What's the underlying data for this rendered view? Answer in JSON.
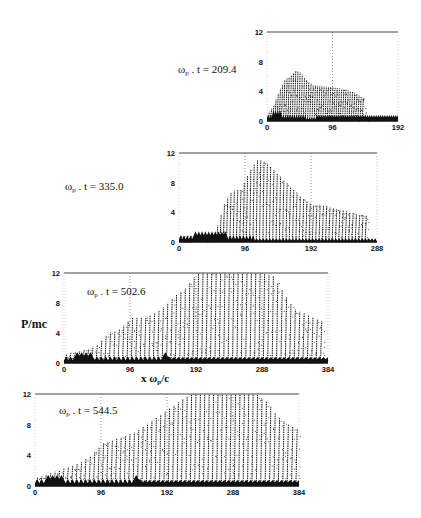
{
  "chart_data": [
    {
      "type": "scatter",
      "title": "ωp . t = 209.4",
      "time_label": {
        "prefix": "ω",
        "sub": "p",
        "text": " . t = 209.4"
      },
      "xlabel": "",
      "ylabel": "",
      "xlim": [
        0,
        192
      ],
      "ylim": [
        0,
        12
      ],
      "xticks": [
        "0",
        "96",
        "192"
      ],
      "yticks": [
        "0",
        "4",
        "8",
        "12"
      ],
      "box": {
        "x": 267,
        "y": 32,
        "w": 131,
        "h": 89
      },
      "envelope": [
        [
          0,
          1
        ],
        [
          8,
          2
        ],
        [
          16,
          4
        ],
        [
          24,
          5.5
        ],
        [
          32,
          6
        ],
        [
          40,
          6.8
        ],
        [
          48,
          6.5
        ],
        [
          56,
          5.5
        ],
        [
          64,
          4.8
        ],
        [
          80,
          4.7
        ],
        [
          96,
          4.5
        ],
        [
          112,
          4.3
        ],
        [
          128,
          3.8
        ],
        [
          140,
          3
        ],
        [
          144,
          0
        ]
      ],
      "dashed_vlines": [
        96,
        192
      ]
    },
    {
      "type": "scatter",
      "title": "ωp . t = 335.0",
      "time_label": {
        "prefix": "ω",
        "sub": "p",
        "text": " . t = 335.0"
      },
      "xlabel": "",
      "ylabel": "",
      "xlim": [
        0,
        288
      ],
      "ylim": [
        0,
        12
      ],
      "xticks": [
        "0",
        "96",
        "192",
        "288"
      ],
      "yticks": [
        "0",
        "4",
        "8",
        "12"
      ],
      "box": {
        "x": 179,
        "y": 153,
        "w": 198,
        "h": 89
      },
      "envelope": [
        [
          0,
          0.8
        ],
        [
          48,
          0.8
        ],
        [
          56,
          2.5
        ],
        [
          64,
          5
        ],
        [
          72,
          6.5
        ],
        [
          80,
          7
        ],
        [
          88,
          7
        ],
        [
          96,
          8.5
        ],
        [
          104,
          10
        ],
        [
          112,
          11
        ],
        [
          120,
          11
        ],
        [
          128,
          10.5
        ],
        [
          144,
          9
        ],
        [
          160,
          7.5
        ],
        [
          176,
          6
        ],
        [
          192,
          5
        ],
        [
          208,
          5
        ],
        [
          224,
          4.5
        ],
        [
          240,
          4.2
        ],
        [
          256,
          3.8
        ],
        [
          272,
          3.5
        ]
      ],
      "dashed_vlines": [
        96,
        192,
        288
      ]
    },
    {
      "type": "scatter",
      "title": "ωp . t = 502.6",
      "time_label": {
        "prefix": "ω",
        "sub": "p",
        "text": " . t = 502.6"
      },
      "xlabel": "x ωp/c",
      "ylabel": "P/mc",
      "xlim": [
        0,
        384
      ],
      "ylim": [
        0,
        12
      ],
      "xticks": [
        "0",
        "96",
        "192",
        "288",
        "384"
      ],
      "yticks": [
        "0",
        "4",
        "8",
        "12"
      ],
      "box": {
        "x": 64,
        "y": 273,
        "w": 264,
        "h": 90
      },
      "envelope": [
        [
          0,
          1.2
        ],
        [
          32,
          1.8
        ],
        [
          48,
          2.5
        ],
        [
          64,
          4
        ],
        [
          80,
          4.5
        ],
        [
          96,
          6
        ],
        [
          112,
          6
        ],
        [
          128,
          6.5
        ],
        [
          144,
          7.5
        ],
        [
          160,
          9
        ],
        [
          176,
          10
        ],
        [
          192,
          12
        ],
        [
          224,
          12
        ],
        [
          256,
          12
        ],
        [
          288,
          12
        ],
        [
          304,
          11.5
        ],
        [
          320,
          9
        ],
        [
          336,
          7
        ],
        [
          352,
          6.5
        ],
        [
          376,
          5.5
        ]
      ],
      "dashed_vlines": [
        96,
        192,
        288,
        384
      ]
    },
    {
      "type": "scatter",
      "title": "ωp . t = 544.5",
      "time_label": {
        "prefix": "ω",
        "sub": "p",
        "text": " . t = 544.5"
      },
      "xlabel": "",
      "ylabel": "",
      "xlim": [
        0,
        384
      ],
      "ylim": [
        0,
        12
      ],
      "xticks": [
        "0",
        "96",
        "192",
        "288",
        "384"
      ],
      "yticks": [
        "0",
        "4",
        "8",
        "12"
      ],
      "box": {
        "x": 35,
        "y": 394,
        "w": 264,
        "h": 92
      },
      "envelope": [
        [
          0,
          1
        ],
        [
          32,
          2
        ],
        [
          64,
          3
        ],
        [
          80,
          4
        ],
        [
          96,
          5.5
        ],
        [
          112,
          6
        ],
        [
          128,
          6.5
        ],
        [
          144,
          7
        ],
        [
          160,
          8
        ],
        [
          176,
          9
        ],
        [
          192,
          10
        ],
        [
          208,
          11
        ],
        [
          224,
          12
        ],
        [
          256,
          12
        ],
        [
          288,
          12
        ],
        [
          320,
          12
        ],
        [
          336,
          11
        ],
        [
          352,
          9
        ],
        [
          368,
          8
        ],
        [
          380,
          7.5
        ]
      ],
      "dashed_vlines": [
        96,
        192,
        288
      ]
    }
  ],
  "labels": {
    "y_axis": "P/mc",
    "x_axis": {
      "prefix": "x  ω",
      "sub": "p",
      "suffix": "/c"
    },
    "panel1": {
      "prefix": "ω",
      "sub": "p",
      "text": " . t = 209.4"
    },
    "panel2": {
      "prefix": "ω",
      "sub": "p",
      "text": " . t = 335.0"
    },
    "panel3": {
      "prefix": "ω",
      "sub": "p",
      "text": " . t = 502.6"
    },
    "panel4": {
      "prefix": "ω",
      "sub": "p",
      "text": " . t = 544.5"
    }
  }
}
